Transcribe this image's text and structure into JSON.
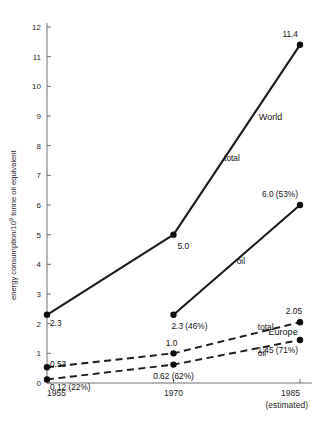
{
  "chart_data": {
    "type": "line",
    "title": "",
    "xlabel": "",
    "ylabel": "energy consumption/10⁹ tonne oil  equivalent",
    "ylabel_parts": {
      "prefix": "energy consumption/10",
      "exponent": "9",
      "suffix": " tonne oil  equivalent"
    },
    "x": [
      1955,
      1970,
      1985
    ],
    "x_tick_labels": [
      "1955",
      "1970",
      "1985"
    ],
    "x_estimated_note": "(estimated)",
    "y_ticks": [
      0,
      1,
      2,
      3,
      4,
      5,
      6,
      7,
      8,
      9,
      10,
      11,
      12
    ],
    "y_tick_labels": [
      "0",
      "1",
      "2",
      "3",
      "4",
      "5",
      "6",
      "7",
      "8",
      "9",
      "10",
      "11",
      "12"
    ],
    "ylim": [
      0,
      12
    ],
    "xlim": [
      1955,
      1985
    ],
    "grid": false,
    "legend_position": "inline-annotations",
    "group_labels": [
      {
        "text": "World",
        "x": 1981.5,
        "y": 8.85
      },
      {
        "text": "Europe",
        "x": 1983.0,
        "y": 1.62
      }
    ],
    "series": [
      {
        "name": "World total",
        "group": "World",
        "style": "solid",
        "inline_label": "total",
        "values": [
          2.3,
          5.0,
          11.4
        ],
        "point_labels": [
          "2.3",
          "5.0",
          "11.4"
        ]
      },
      {
        "name": "World oil",
        "group": "World",
        "style": "solid",
        "inline_label": "oil",
        "values": [
          null,
          2.3,
          6.0
        ],
        "point_labels": [
          null,
          "2.3 (46%)",
          "6.0 (53%)"
        ]
      },
      {
        "name": "Europe total",
        "group": "Europe",
        "style": "dashed",
        "inline_label": "total",
        "values": [
          0.53,
          1.0,
          2.05
        ],
        "point_labels": [
          "0.53",
          "1.0",
          "2.05"
        ]
      },
      {
        "name": "Europe oil",
        "group": "Europe",
        "style": "dashed",
        "inline_label": "oil",
        "values": [
          0.12,
          0.62,
          1.45
        ],
        "point_labels": [
          "0.12 (22%)",
          "0.62 (62%)",
          "1.45 (71%)"
        ]
      }
    ],
    "inline_series_labels": [
      {
        "text": "total",
        "series": "World total",
        "x": 1976.0,
        "y": 7.5
      },
      {
        "text": "oil",
        "series": "World oil",
        "x": 1977.5,
        "y": 4.0
      },
      {
        "text": "total",
        "series": "Europe total",
        "x": 1980.0,
        "y": 1.78
      },
      {
        "text": "oil",
        "series": "Europe oil",
        "x": 1980.0,
        "y": 0.92
      }
    ],
    "colors": {
      "line": "#1a1a1a",
      "marker": "#0d0d0d",
      "axis": "#6f6f6f",
      "text": "#1f1f1f",
      "background": "#ffffff"
    }
  }
}
